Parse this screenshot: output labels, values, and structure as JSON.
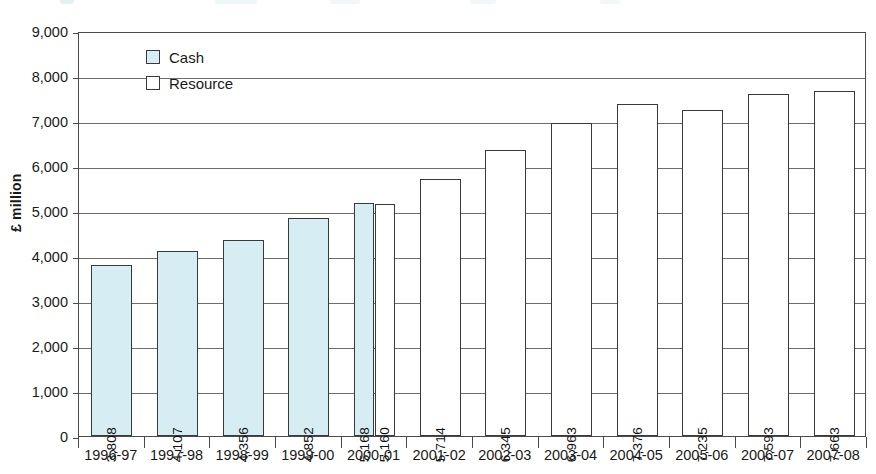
{
  "chart_data": {
    "type": "bar",
    "title": "",
    "xlabel": "",
    "ylabel": "£ million",
    "ylim": [
      0,
      9000
    ],
    "ytick_labels": [
      "9,000",
      "8,000",
      "7,000",
      "6,000",
      "5,000",
      "4,000",
      "3,000",
      "2,000",
      "1,000",
      "0"
    ],
    "ytick_values": [
      9000,
      8000,
      7000,
      6000,
      5000,
      4000,
      3000,
      2000,
      1000,
      0
    ],
    "grid": true,
    "legend_position": "inside-top-left",
    "categories": [
      "1996-97",
      "1997-98",
      "1998-99",
      "1999-00",
      "2000-01",
      "2001-02",
      "2002-03",
      "2003-04",
      "2004-05",
      "2005-06",
      "2006-07",
      "2007-08"
    ],
    "series": [
      {
        "name": "Cash",
        "color": "#d6eef3",
        "values": [
          3808,
          4107,
          4356,
          4852,
          5168,
          null,
          null,
          null,
          null,
          null,
          null,
          null
        ],
        "labels": [
          "3,808",
          "4,107",
          "4,356",
          "4,852",
          "5,168",
          "",
          "",
          "",
          "",
          "",
          "",
          ""
        ]
      },
      {
        "name": "Resource",
        "color": "#ffffff",
        "values": [
          null,
          null,
          null,
          null,
          5160,
          5714,
          6345,
          6963,
          7376,
          7235,
          7593,
          7663
        ],
        "labels": [
          "",
          "",
          "",
          "",
          "5,160",
          "5,714",
          "6,345",
          "6,963",
          "7,376",
          "7,235",
          "7,593",
          "7,663"
        ]
      }
    ]
  },
  "legend": {
    "items": [
      {
        "label": "Cash",
        "swatch": "cash"
      },
      {
        "label": "Resource",
        "swatch": "resource"
      }
    ]
  }
}
